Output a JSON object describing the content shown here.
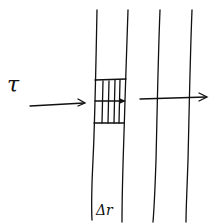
{
  "diagram": {
    "labels": {
      "tau": "τ",
      "delta_r": "Δr"
    },
    "elements": {
      "vertical_lines": 4,
      "hatched_band": "shaded strip between first two lines",
      "incoming_arrow": "horizontal arrow pointing right toward band",
      "outgoing_arrow": "horizontal arrow continuing to the right"
    },
    "colors": {
      "ink": "#111111",
      "background": "#ffffff"
    }
  }
}
